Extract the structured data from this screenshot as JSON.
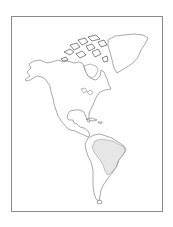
{
  "map": {
    "title": "Outline map of the Americas",
    "region": "North and South America",
    "highlighted_country": "Brazil",
    "colors": {
      "background": "#ffffff",
      "frame_border": "#8a8a8a",
      "coastline": "#6f6f6f",
      "highlight_fill": "#e6e6e6"
    },
    "features": [
      {
        "name": "Alaska"
      },
      {
        "name": "Canadian Arctic Archipelago"
      },
      {
        "name": "Greenland"
      },
      {
        "name": "Hudson Bay"
      },
      {
        "name": "Great Lakes"
      },
      {
        "name": "Gulf of Mexico"
      },
      {
        "name": "Central America"
      },
      {
        "name": "Caribbean"
      },
      {
        "name": "South America"
      },
      {
        "name": "Brazil",
        "highlighted": true
      }
    ]
  }
}
